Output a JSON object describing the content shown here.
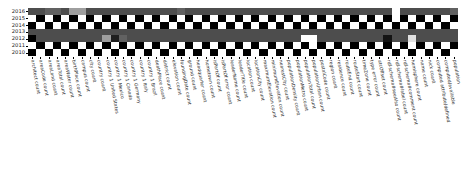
{
  "figure": {
    "kind": "heatmap",
    "background": "#ffffff"
  },
  "axes": {
    "y_title": "",
    "x_title": "",
    "y_ticks": [
      "2016",
      "2015",
      "2014",
      "2013",
      "2012",
      "2011",
      "2010"
    ],
    "x_ticks": [
      "architect count",
      "areaCode count",
      "areaLand count",
      "areaTotal count",
      "areaWater count",
      "birthPlace count",
      "campus count",
      "city count",
      "country count",
      "country 1 United States",
      "country 1 Mexico",
      "country 1 Canada",
      "country 1 Germany",
      "country 1 Italy",
      "country 1 Brazil",
      "deathPlace count",
      "district count",
      "elevation count",
      "foundingDate count",
      "ground count",
      "headquarter count",
      "hometown count",
      "isPartOf count",
      "isPartOf error count",
      "leaderName count",
      "leaderTitle count",
      "location count",
      "locationCity count",
      "maximumElevation count",
      "minimumElevation count",
      "nearestCity count",
      "populationDensity count",
      "populationMetro count",
      "populationTotal count",
      "populationUrban count",
      "postalCode count",
      "region count",
      "residence count",
      "routeEnd count",
      "routeStart count",
      "timeZone count",
      "type error count",
      "utcOffset count",
      "rdf-schema#seeAlso count",
      "rdf-schema#label count",
      "rdf-schema#comment count",
      "hemisphere count",
      "name count",
      "nick count",
      "computed attribute/defined",
      "computed/available",
      "population"
    ]
  },
  "chart_data": {
    "type": "heatmap",
    "title": "",
    "xlabel": "",
    "ylabel": "",
    "colormap": "gray",
    "vmin": 0,
    "vmax": 1,
    "grid": false,
    "legend": "none",
    "row_labels": [
      "2016",
      "2015",
      "2014",
      "2013",
      "2012",
      "2011",
      "2010"
    ],
    "column_labels": [
      "architect count",
      "areaCode count",
      "areaLand count",
      "areaTotal count",
      "areaWater count",
      "birthPlace count",
      "campus count",
      "city count",
      "country count",
      "country 1 United States",
      "country 1 Mexico",
      "country 1 Canada",
      "country 1 Germany",
      "country 1 Italy",
      "country 1 Brazil",
      "deathPlace count",
      "district count",
      "elevation count",
      "foundingDate count",
      "ground count",
      "headquarter count",
      "hometown count",
      "isPartOf count",
      "isPartOf error count",
      "leaderName count",
      "leaderTitle count",
      "location count",
      "locationCity count",
      "maximumElevation count",
      "minimumElevation count",
      "nearestCity count",
      "populationDensity count",
      "populationMetro count",
      "populationTotal count",
      "populationUrban count",
      "postalCode count",
      "region count",
      "residence count",
      "routeEnd count",
      "routeStart count",
      "timeZone count",
      "type error count",
      "utcOffset count",
      "rdf-schema#seeAlso count",
      "rdf-schema#label count",
      "rdf-schema#comment count",
      "hemisphere count",
      "name count",
      "nick count",
      "computed attribute/defined",
      "computed/available",
      "population"
    ],
    "values": [
      [
        0.3,
        0.3,
        0.38,
        0.38,
        0.3,
        0.62,
        0.62,
        0.3,
        0.3,
        0.3,
        0.3,
        0.3,
        0.3,
        0.3,
        0.3,
        0.3,
        0.3,
        0.3,
        0.38,
        0.3,
        0.3,
        0.3,
        0.3,
        0.3,
        0.3,
        0.3,
        0.3,
        0.3,
        0.3,
        0.3,
        0.3,
        0.3,
        0.3,
        0.3,
        0.3,
        0.3,
        0.3,
        0.3,
        0.3,
        0.3,
        0.3,
        0.3,
        0.3,
        0.3,
        1.0,
        0.3,
        0.3,
        0.3,
        0.3,
        0.3,
        0.3,
        0.38
      ],
      [
        1.0,
        0.0,
        1.0,
        0.0,
        1.0,
        0.0,
        1.0,
        0.0,
        1.0,
        0.0,
        1.0,
        0.0,
        1.0,
        0.0,
        1.0,
        0.0,
        1.0,
        0.0,
        1.0,
        0.0,
        1.0,
        0.0,
        1.0,
        0.0,
        1.0,
        0.0,
        1.0,
        0.0,
        1.0,
        0.0,
        1.0,
        0.0,
        1.0,
        0.0,
        1.0,
        0.0,
        1.0,
        0.0,
        1.0,
        0.0,
        1.0,
        0.0,
        1.0,
        0.0,
        1.0,
        0.0,
        1.0,
        0.0,
        1.0,
        0.0,
        1.0,
        0.0
      ],
      [
        0.0,
        1.0,
        0.0,
        1.0,
        0.0,
        1.0,
        0.0,
        1.0,
        0.0,
        1.0,
        0.0,
        1.0,
        0.0,
        1.0,
        0.0,
        1.0,
        0.0,
        1.0,
        0.0,
        1.0,
        0.0,
        1.0,
        0.0,
        1.0,
        0.0,
        1.0,
        0.0,
        1.0,
        0.0,
        1.0,
        0.0,
        1.0,
        0.0,
        1.0,
        0.0,
        1.0,
        0.0,
        1.0,
        0.0,
        1.0,
        0.0,
        1.0,
        0.0,
        1.0,
        0.0,
        1.0,
        0.0,
        1.0,
        0.0,
        1.0,
        0.0,
        1.0
      ],
      [
        0.3,
        0.3,
        0.3,
        0.3,
        0.3,
        0.3,
        0.3,
        0.3,
        0.3,
        0.3,
        0.3,
        0.3,
        0.3,
        0.3,
        0.3,
        0.3,
        0.3,
        0.3,
        0.3,
        0.3,
        0.3,
        0.3,
        0.3,
        0.3,
        0.3,
        0.3,
        0.3,
        0.3,
        0.3,
        0.3,
        0.3,
        0.3,
        0.3,
        0.3,
        0.3,
        0.3,
        0.3,
        0.3,
        0.3,
        0.3,
        0.3,
        0.3,
        0.3,
        0.3,
        0.3,
        0.3,
        0.3,
        0.3,
        0.3,
        0.3,
        0.3,
        0.3
      ],
      [
        0.0,
        0.3,
        0.3,
        0.3,
        0.3,
        0.3,
        0.3,
        0.3,
        0.3,
        0.62,
        0.12,
        0.38,
        0.3,
        0.3,
        0.3,
        0.3,
        0.3,
        0.3,
        0.3,
        0.3,
        0.3,
        0.3,
        0.3,
        0.3,
        0.3,
        0.3,
        0.3,
        0.3,
        0.3,
        0.3,
        0.3,
        0.3,
        0.3,
        1.0,
        1.0,
        0.3,
        0.3,
        0.3,
        0.3,
        0.3,
        0.3,
        0.3,
        0.3,
        0.08,
        0.3,
        0.3,
        0.88,
        0.3,
        0.3,
        0.3,
        0.3,
        0.3
      ],
      [
        1.0,
        0.0,
        1.0,
        0.0,
        1.0,
        0.0,
        1.0,
        0.0,
        1.0,
        0.0,
        1.0,
        0.0,
        1.0,
        0.0,
        1.0,
        0.0,
        1.0,
        0.0,
        1.0,
        0.0,
        1.0,
        0.0,
        1.0,
        0.0,
        1.0,
        0.0,
        1.0,
        0.0,
        1.0,
        0.0,
        1.0,
        0.0,
        1.0,
        0.0,
        1.0,
        0.0,
        1.0,
        0.0,
        1.0,
        0.0,
        1.0,
        0.0,
        1.0,
        0.0,
        1.0,
        0.0,
        1.0,
        0.0,
        1.0,
        0.0,
        1.0,
        0.0
      ],
      [
        0.0,
        1.0,
        0.0,
        1.0,
        0.0,
        1.0,
        0.0,
        1.0,
        0.0,
        1.0,
        0.0,
        1.0,
        0.0,
        1.0,
        0.0,
        1.0,
        0.0,
        1.0,
        0.0,
        1.0,
        0.0,
        1.0,
        0.0,
        1.0,
        0.0,
        1.0,
        0.0,
        1.0,
        0.0,
        1.0,
        0.0,
        1.0,
        0.0,
        1.0,
        0.0,
        1.0,
        0.0,
        1.0,
        0.0,
        1.0,
        0.0,
        1.0,
        0.0,
        1.0,
        0.0,
        1.0,
        0.0,
        1.0,
        0.0,
        1.0,
        0.0,
        1.0
      ]
    ]
  }
}
